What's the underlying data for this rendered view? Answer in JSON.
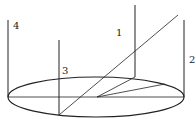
{
  "diagram": {
    "colors": {
      "line": "#222222",
      "background": "#ffffff"
    },
    "labels": {
      "pole1": "1",
      "pole2": "2",
      "pole3": "3",
      "pole4": "4"
    },
    "ellipse": {
      "cx": 96,
      "cy": 97,
      "rx": 88,
      "ry": 20
    },
    "poles": [
      {
        "id": "1",
        "x": 135,
        "y_top": 5,
        "y_bottom": 77
      },
      {
        "id": "2",
        "x": 184,
        "y_top": 20,
        "y_bottom": 97
      },
      {
        "id": "3",
        "x": 59,
        "y_top": 40,
        "y_bottom": 115
      },
      {
        "id": "4",
        "x": 8,
        "y_top": 20,
        "y_bottom": 97
      }
    ],
    "lines": [
      {
        "name": "diameter",
        "x1": 8,
        "y1": 97,
        "x2": 184,
        "y2": 97
      },
      {
        "name": "ray",
        "x1": 59,
        "y1": 115,
        "x2": 178,
        "y2": 15
      },
      {
        "name": "projection-to-pole1",
        "x1": 97,
        "y1": 97,
        "x2": 135,
        "y2": 77
      },
      {
        "name": "radius-line",
        "x1": 97,
        "y1": 97,
        "x2": 165,
        "y2": 84
      }
    ]
  }
}
